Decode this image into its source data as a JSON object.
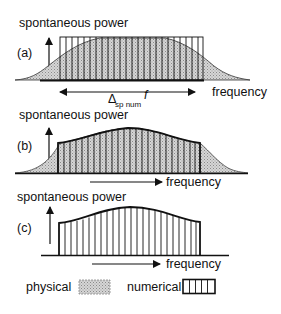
{
  "figure": {
    "panels": [
      {
        "id": "a",
        "panel_label": "(a)",
        "y_axis_label": "spontaneous power",
        "x_axis_label": "frequency",
        "bandwidth_symbol": "Δ",
        "bandwidth_subscript": "sp num",
        "bandwidth_var": "f",
        "description": "Physical gain-shaped spectrum (shaded) vs. flat numerical spectrum (rectangular bars) spanning a bandwidth"
      },
      {
        "id": "b",
        "panel_label": "(b)",
        "y_axis_label": "spontaneous power",
        "x_axis_label": "frequency",
        "description": "Numerical bars follow the physical spectrum shape within the truncated bandwidth"
      },
      {
        "id": "c",
        "panel_label": "(c)",
        "y_axis_label": "spontaneous power",
        "x_axis_label": "frequency",
        "description": "Numerical spectrum only, shaped like the physical one, truncated at edges"
      }
    ],
    "legend": [
      {
        "label": "physical",
        "pattern": "dotted-gray-fill"
      },
      {
        "label": "numerical",
        "pattern": "vertical-bars"
      }
    ],
    "colors": {
      "line": "#111111",
      "physical_fill": "#c8c8c8",
      "background": "#ffffff"
    }
  }
}
